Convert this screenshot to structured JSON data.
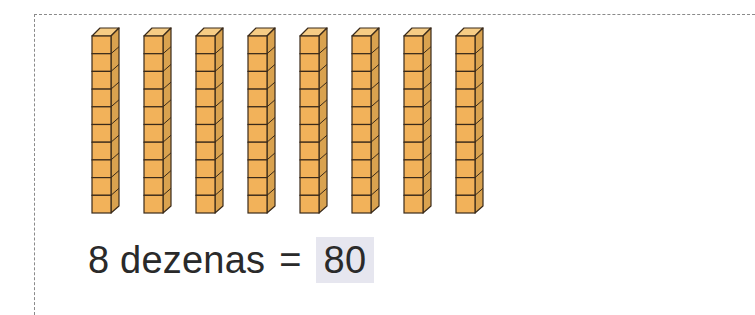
{
  "exercise": {
    "rod_count": 8,
    "cubes_per_rod": 10,
    "rod_positions_x": [
      91,
      143,
      195,
      247,
      299,
      351,
      403,
      455
    ],
    "colors": {
      "front": "#f2b25a",
      "top": "#f6cc85",
      "side": "#d9a24f",
      "outline": "#3a2a1a",
      "answer_highlight": "#e6e6ef"
    },
    "equation": {
      "left": "8 dezenas",
      "operator": "=",
      "answer": "80"
    }
  }
}
